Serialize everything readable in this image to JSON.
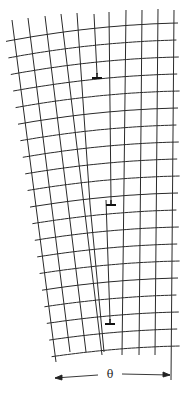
{
  "figure": {
    "angle_label": "θ",
    "colors": {
      "line": "#2a2a2a",
      "background": "#ffffff"
    }
  },
  "lattice": {
    "row_count": 20,
    "row_spacing": 17,
    "top_row_y_right": 23,
    "arc_sag": 6,
    "top_columns_x": [
      12,
      28,
      45,
      61,
      77,
      94,
      109,
      126,
      142,
      158,
      174
    ],
    "bottom_columns_x": [
      53,
      69,
      85,
      102,
      122,
      139,
      155,
      172
    ],
    "bottom_y": 356
  },
  "dislocations": [
    {
      "label": "edge-dislocation-1",
      "symbol": "⊥",
      "x": 97,
      "y": 78
    },
    {
      "label": "edge-dislocation-2",
      "symbol": "⊥",
      "x": 111,
      "y": 205
    },
    {
      "label": "edge-dislocation-3",
      "symbol": "⊥",
      "x": 110,
      "y": 324
    }
  ],
  "dimension": {
    "label": "θ",
    "left_x": 55,
    "left_y": 378,
    "right_x": 170,
    "right_y": 375
  }
}
